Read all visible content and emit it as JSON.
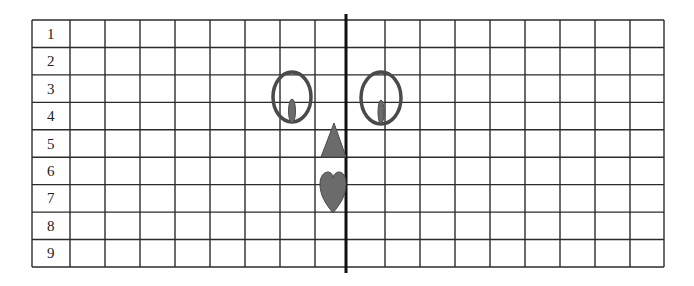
{
  "grid": {
    "row_labels": [
      "1",
      "2",
      "3",
      "4",
      "5",
      "6",
      "7",
      "8",
      "9"
    ],
    "rows": 9,
    "data_columns": 17,
    "left_data_columns": 8,
    "right_data_columns": 9,
    "line_color": "#2b2b2b",
    "symmetry_line_color": "#111111"
  },
  "shapes": [
    {
      "name": "left-eye",
      "type": "oval-with-pupil",
      "row_span": [
        "3",
        "4"
      ],
      "side": "left"
    },
    {
      "name": "right-eye",
      "type": "oval-with-pupil",
      "row_span": [
        "3",
        "4"
      ],
      "side": "right"
    },
    {
      "name": "nose",
      "type": "triangle",
      "row": "5",
      "side": "left"
    },
    {
      "name": "mouth",
      "type": "heart",
      "row_span": [
        "6",
        "7"
      ],
      "side": "left"
    }
  ],
  "colors": {
    "shape_outline": "#4a4a4a",
    "shape_fill": "#6b6b6b"
  }
}
